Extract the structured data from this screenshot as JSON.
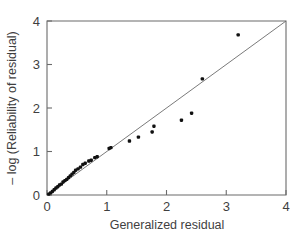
{
  "chart_data": {
    "type": "scatter",
    "title": "",
    "xlabel": "Generalized residual",
    "ylabel": "– log (Reliability of residual)",
    "xlim": [
      0,
      4
    ],
    "ylim": [
      0,
      4
    ],
    "xticks": [
      0,
      1,
      2,
      3,
      4
    ],
    "yticks": [
      0,
      1,
      2,
      3,
      4
    ],
    "xticklabels": [
      "0",
      "1",
      "2",
      "3",
      "4"
    ],
    "yticklabels": [
      "0",
      "1",
      "2",
      "3",
      "4"
    ],
    "grid": false,
    "legend": null,
    "marker": "filled-square-dot",
    "marker_color": "#111111",
    "axis_color": "#6b6b6b",
    "background": "#ffffff",
    "reference_line": {
      "name": "identity-line",
      "x": [
        0,
        4
      ],
      "y": [
        0,
        4
      ],
      "style": "solid",
      "color": "#6b6b6b"
    },
    "series": [
      {
        "name": "residual-points",
        "points": [
          [
            0.03,
            0.02
          ],
          [
            0.06,
            0.05
          ],
          [
            0.09,
            0.08
          ],
          [
            0.12,
            0.12
          ],
          [
            0.15,
            0.16
          ],
          [
            0.18,
            0.19
          ],
          [
            0.21,
            0.23
          ],
          [
            0.24,
            0.25
          ],
          [
            0.27,
            0.3
          ],
          [
            0.3,
            0.33
          ],
          [
            0.33,
            0.36
          ],
          [
            0.36,
            0.4
          ],
          [
            0.39,
            0.44
          ],
          [
            0.42,
            0.48
          ],
          [
            0.45,
            0.52
          ],
          [
            0.48,
            0.57
          ],
          [
            0.52,
            0.6
          ],
          [
            0.56,
            0.64
          ],
          [
            0.6,
            0.7
          ],
          [
            0.64,
            0.73
          ],
          [
            0.7,
            0.78
          ],
          [
            0.74,
            0.8
          ],
          [
            0.8,
            0.86
          ],
          [
            0.84,
            0.88
          ],
          [
            1.04,
            1.07
          ],
          [
            1.07,
            1.09
          ],
          [
            1.38,
            1.24
          ],
          [
            1.53,
            1.33
          ],
          [
            1.76,
            1.45
          ],
          [
            1.79,
            1.58
          ],
          [
            2.25,
            1.72
          ],
          [
            2.42,
            1.88
          ],
          [
            2.6,
            2.67
          ],
          [
            3.2,
            3.68
          ]
        ]
      }
    ]
  }
}
